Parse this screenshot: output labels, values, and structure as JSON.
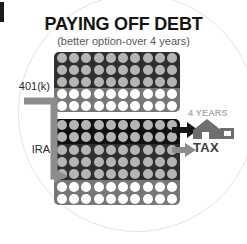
{
  "title": "PAYING OFF DEBT",
  "subtitle": "(better option-over 4 years)",
  "labels": {
    "plan_a": "401(k)",
    "plan_b": "IRA",
    "years": "4 YEARS",
    "tax": "TAX"
  },
  "colors": {
    "dark_bg": "#2f2f2f",
    "darkest_bg": "#111111",
    "mid_bg": "#777777",
    "gray_dot": "#b5b5b5",
    "white_dot": "#ffffff",
    "black_arrow": "#151515",
    "gray_arrow": "#8d8d8d",
    "connector": "#8d8d8d",
    "house": "#6e6e6e",
    "years_text": "#adadad",
    "tax_text": "#3d3d3d",
    "title_text": "#141414",
    "subtitle_text": "#595959"
  },
  "chart_data": {
    "type": "table",
    "title": "PAYING OFF DEBT",
    "subtitle": "(better option-over 4 years)",
    "xlabel": "",
    "ylabel": "",
    "grid": false,
    "legend": "none",
    "columns_per_row": 10,
    "series": [
      {
        "name": "401(k)",
        "rows": 5,
        "values": [
          10,
          10,
          10,
          10,
          10
        ],
        "row_styles": [
          {
            "bg": "#2f2f2f",
            "dot": "#b5b5b5"
          },
          {
            "bg": "#2f2f2f",
            "dot": "#b5b5b5"
          },
          {
            "bg": "#2f2f2f",
            "dot": "#b5b5b5"
          },
          {
            "bg": "#777777",
            "dot": "#ffffff"
          },
          {
            "bg": "#777777",
            "dot": "#ffffff"
          }
        ]
      },
      {
        "name": "IRA",
        "rows": 7,
        "values": [
          10,
          10,
          10,
          10,
          10,
          10,
          10
        ],
        "row_styles": [
          {
            "bg": "#111111",
            "dot": "#b5b5b5"
          },
          {
            "bg": "#111111",
            "dot": "#b5b5b5"
          },
          {
            "bg": "#2f2f2f",
            "dot": "#b5b5b5"
          },
          {
            "bg": "#2f2f2f",
            "dot": "#b5b5b5"
          },
          {
            "bg": "#2f2f2f",
            "dot": "#b5b5b5"
          },
          {
            "bg": "#777777",
            "dot": "#ffffff"
          },
          {
            "bg": "#777777",
            "dot": "#ffffff"
          }
        ]
      }
    ],
    "annotations": [
      "4 YEARS",
      "TAX",
      "401(k)",
      "IRA"
    ]
  }
}
